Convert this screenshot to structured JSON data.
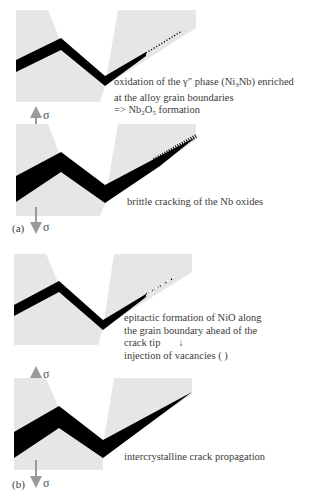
{
  "colors": {
    "grain": "#e6e6e6",
    "crack": "#000000",
    "arrow": "#9a9a9a",
    "text": "#3c3c3c"
  },
  "stress_symbol": "σ",
  "panels": [
    {
      "id": "a1",
      "label_lines": [
        "oxidation of the  γ\" phase (Ni3Nb) enriched",
        "at the alloy grain boundaries",
        "=> Nb2O5  formation"
      ],
      "tip_marker": "fine-dots"
    },
    {
      "id": "a2",
      "label_lines": [
        "brittle cracking of the Nb oxides"
      ],
      "tip_marker": "serrated-oxide",
      "panel_letter": "(a)"
    },
    {
      "id": "b1",
      "label_lines": [
        "epitactic formation of  NiO along",
        "the grain boundary ahead of the",
        "crack tip",
        "injection of vacancies (  )"
      ],
      "tip_marker": "vacancy-dots",
      "arrow_glyph": "↓"
    },
    {
      "id": "b2",
      "label_lines": [
        "intercrystalline crack propagation"
      ],
      "tip_marker": "none",
      "panel_letter": "(b)"
    }
  ]
}
